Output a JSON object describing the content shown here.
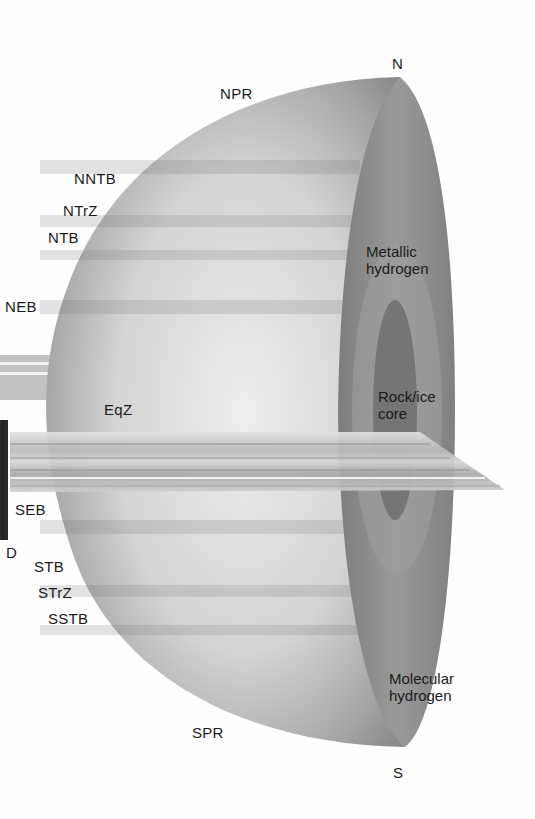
{
  "diagram": {
    "poles": {
      "north": "N",
      "south": "S"
    },
    "belt_labels": {
      "npr": "NPR",
      "nntb": "NNTB",
      "ntrz": "NTrZ",
      "ntb": "NTB",
      "neb": "NEB",
      "eqz": "EqZ",
      "seb": "SEB",
      "d": "D",
      "stb": "STB",
      "strz": "STrZ",
      "sstb": "SSTB",
      "spr": "SPR"
    },
    "interior_labels": {
      "metallic": "Metallic\nhydrogen",
      "core": "Rock/ice\ncore",
      "molecular": "Molecular\nhydrogen"
    },
    "colors": {
      "surface_light": "#e6e6e6",
      "surface_dark": "#8a8a8a",
      "cut_face": "#8c8c8c",
      "core": "#737373",
      "ring": "#c8c8c8"
    }
  }
}
